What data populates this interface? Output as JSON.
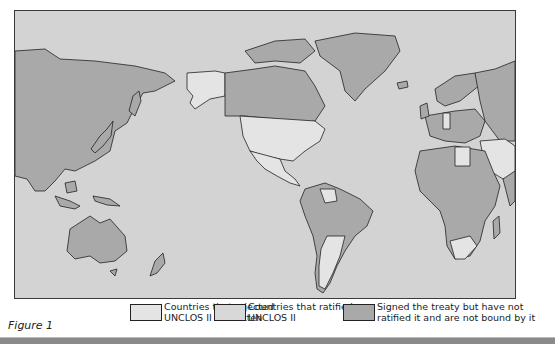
{
  "figure": {
    "label": "Figure 1",
    "type": "world-map"
  },
  "colors": {
    "ocean": "#d3d3d3",
    "rejected": "#e4e4e4",
    "ratified": "#d8d8d8",
    "signed_not_ratified": "#a9a9a9",
    "border": "#222222"
  },
  "legend": {
    "items": [
      {
        "line1": "Countries that rejected",
        "line2": "UNCLOS II as written",
        "color": "#e4e4e4"
      },
      {
        "line1": "Countries that ratified",
        "line2": "UNCLOS II",
        "color": "#d8d8d8"
      },
      {
        "line1": "Signed the treaty but have not",
        "line2": "ratified it and are not bound by it",
        "color": "#a9a9a9"
      }
    ]
  }
}
